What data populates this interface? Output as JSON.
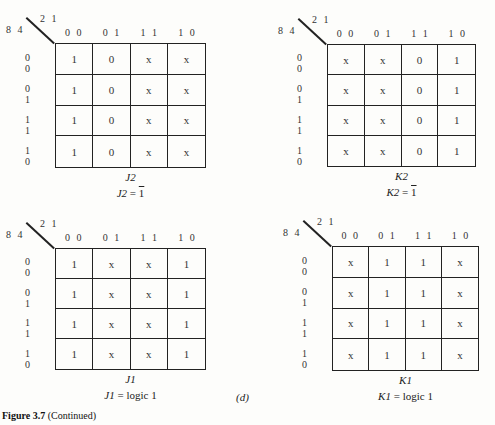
{
  "figure": {
    "caption_bold": "Figure 3.7",
    "caption_rest": " (Continued)",
    "sublabel": "(d)"
  },
  "axes": {
    "row_var_label": "8 4",
    "col_var_label": "2 1",
    "col_headers": [
      "0 0",
      "0 1",
      "1 1",
      "1 0"
    ],
    "row_headers": [
      "0 0",
      "0 1",
      "1 1",
      "1 0"
    ]
  },
  "kmaps": [
    {
      "name": "J2",
      "eq_var": "J2",
      "eq_sign": " = ",
      "eq_value": "1",
      "eq_overline": true,
      "cells": [
        [
          "1",
          "0",
          "x",
          "x"
        ],
        [
          "1",
          "0",
          "x",
          "x"
        ],
        [
          "1",
          "0",
          "x",
          "x"
        ],
        [
          "1",
          "0",
          "x",
          "x"
        ]
      ]
    },
    {
      "name": "K2",
      "eq_var": "K2",
      "eq_sign": " = ",
      "eq_value": "1",
      "eq_overline": true,
      "cells": [
        [
          "x",
          "x",
          "0",
          "1"
        ],
        [
          "x",
          "x",
          "0",
          "1"
        ],
        [
          "x",
          "x",
          "0",
          "1"
        ],
        [
          "x",
          "x",
          "0",
          "1"
        ]
      ]
    },
    {
      "name": "J1",
      "eq_var": "J1",
      "eq_sign": " = ",
      "eq_value": "logic 1",
      "eq_overline": false,
      "cells": [
        [
          "1",
          "x",
          "x",
          "1"
        ],
        [
          "1",
          "x",
          "x",
          "1"
        ],
        [
          "1",
          "x",
          "x",
          "1"
        ],
        [
          "1",
          "x",
          "x",
          "1"
        ]
      ]
    },
    {
      "name": "K1",
      "eq_var": "K1",
      "eq_sign": " = ",
      "eq_value": "logic 1",
      "eq_overline": false,
      "cells": [
        [
          "x",
          "1",
          "1",
          "x"
        ],
        [
          "x",
          "1",
          "1",
          "x"
        ],
        [
          "x",
          "1",
          "1",
          "x"
        ],
        [
          "x",
          "1",
          "1",
          "x"
        ]
      ]
    }
  ]
}
